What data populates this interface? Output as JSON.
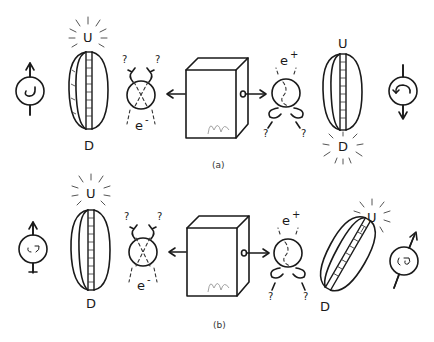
{
  "figure": {
    "panels": [
      {
        "id": "a",
        "caption": "(a)",
        "left_spin": {
          "direction": "up",
          "rotation": "counterclockwise"
        },
        "left_detector": {
          "top_label": "U",
          "bottom_label": "D",
          "lit": "U",
          "orientation": "vertical"
        },
        "left_particle": {
          "label": "e",
          "charge_sign": "-",
          "question_marks": [
            "?",
            "?"
          ]
        },
        "source": {
          "name": "source-box"
        },
        "right_particle": {
          "label": "e",
          "charge_sign": "+",
          "question_marks": [
            "?",
            "?"
          ]
        },
        "right_detector": {
          "top_label": "U",
          "bottom_label": "D",
          "lit": "D",
          "orientation": "vertical"
        },
        "right_spin": {
          "direction": "down",
          "rotation": "clockwise"
        }
      },
      {
        "id": "b",
        "caption": "(b)",
        "left_spin": {
          "direction": "up",
          "rotation": "unknown"
        },
        "left_detector": {
          "top_label": "U",
          "bottom_label": "D",
          "lit": "U",
          "orientation": "vertical"
        },
        "left_particle": {
          "label": "e",
          "charge_sign": "-",
          "question_marks": [
            "?",
            "?"
          ]
        },
        "source": {
          "name": "source-box"
        },
        "right_particle": {
          "label": "e",
          "charge_sign": "+",
          "question_marks": [
            "?",
            "?"
          ]
        },
        "right_detector": {
          "top_label": "U",
          "bottom_label": "D",
          "lit": "U",
          "orientation": "tilted"
        },
        "right_spin": {
          "direction": "up-right",
          "rotation": "unknown"
        }
      }
    ]
  }
}
